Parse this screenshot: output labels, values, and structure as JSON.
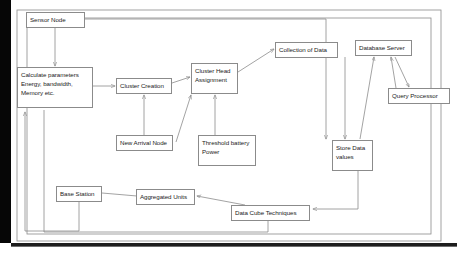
{
  "diagram": {
    "type": "flowchart",
    "stroke_color": "#8b8b8b",
    "text_color": "#1b1b1b",
    "background_color": "#ffffff",
    "nodes": [
      {
        "id": "sensor_node",
        "label": "Sensor Node"
      },
      {
        "id": "calculate_parameters",
        "label": "Calculate  parameters\nEnergy, bandwidth,\nMemory etc."
      },
      {
        "id": "cluster_creation",
        "label": "Cluster Creation"
      },
      {
        "id": "cluster_head_assignment",
        "label": "Cluster Head\nAssignment"
      },
      {
        "id": "collection_of_data",
        "label": "Collection of Data"
      },
      {
        "id": "database_server",
        "label": "Database Server"
      },
      {
        "id": "query_processor",
        "label": "Query Processor"
      },
      {
        "id": "store_data_values",
        "label": "Store Data\nvalues"
      },
      {
        "id": "new_arrival_node",
        "label": "New Arrival Node"
      },
      {
        "id": "threshold_battery_power",
        "label": "Threshold battery\nPower"
      },
      {
        "id": "base_station",
        "label": "Base Station"
      },
      {
        "id": "aggregated_units",
        "label": "Aggregated Units"
      },
      {
        "id": "data_cube_techniques",
        "label": "Data Cube Techniques"
      }
    ],
    "edges": [
      {
        "from": "sensor_node",
        "to": "calculate_parameters"
      },
      {
        "from": "sensor_node",
        "to": "store_data_values"
      },
      {
        "from": "calculate_parameters",
        "to": "cluster_creation"
      },
      {
        "from": "cluster_creation",
        "to": "cluster_head_assignment"
      },
      {
        "from": "new_arrival_node",
        "to": "cluster_creation"
      },
      {
        "from": "new_arrival_node",
        "to": "cluster_head_assignment"
      },
      {
        "from": "threshold_battery_power",
        "to": "cluster_head_assignment"
      },
      {
        "from": "cluster_head_assignment",
        "to": "collection_of_data"
      },
      {
        "from": "collection_of_data",
        "to": "store_data_values"
      },
      {
        "from": "store_data_values",
        "to": "database_server"
      },
      {
        "from": "database_server",
        "to": "query_processor"
      },
      {
        "from": "query_processor",
        "to": "database_server"
      },
      {
        "from": "store_data_values",
        "to": "data_cube_techniques"
      },
      {
        "from": "data_cube_techniques",
        "to": "aggregated_units"
      },
      {
        "from": "aggregated_units",
        "to": "base_station"
      },
      {
        "from": "base_station",
        "to": "calculate_parameters"
      },
      {
        "from": "data_cube_techniques",
        "to": "calculate_parameters"
      }
    ]
  }
}
